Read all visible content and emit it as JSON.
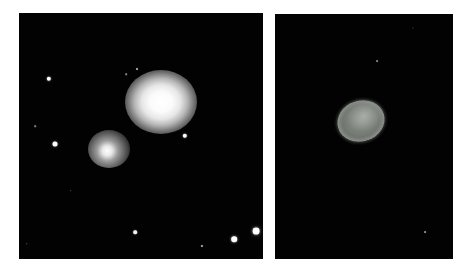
{
  "figure": {
    "panels": [
      {
        "id": "left",
        "description": "Deep-sky field with a large elliptical galaxy and a smaller fuzzy companion galaxy among foreground stars",
        "background_color": "#020202",
        "galaxies": [
          {
            "name": "large-elliptical",
            "cx": 142,
            "cy": 89,
            "w": 72,
            "h": 64
          },
          {
            "name": "small-companion",
            "cx": 90,
            "cy": 136,
            "w": 42,
            "h": 38
          }
        ],
        "stars": [
          {
            "cx": 30,
            "cy": 66,
            "r": 2.2,
            "brightness": 1.0
          },
          {
            "cx": 36,
            "cy": 131,
            "r": 2.5,
            "brightness": 1.0
          },
          {
            "cx": 16,
            "cy": 113,
            "r": 0.8,
            "brightness": 0.5
          },
          {
            "cx": 166,
            "cy": 123,
            "r": 2.2,
            "brightness": 1.0
          },
          {
            "cx": 118,
            "cy": 56,
            "r": 1.0,
            "brightness": 0.7
          },
          {
            "cx": 107,
            "cy": 61,
            "r": 0.8,
            "brightness": 0.5
          },
          {
            "cx": 116,
            "cy": 219,
            "r": 1.8,
            "brightness": 0.95
          },
          {
            "cx": 183,
            "cy": 233,
            "r": 1.1,
            "brightness": 0.7
          },
          {
            "cx": 215,
            "cy": 226,
            "r": 2.8,
            "brightness": 1.0
          },
          {
            "cx": 237,
            "cy": 218,
            "r": 3.4,
            "brightness": 1.0
          },
          {
            "cx": 8,
            "cy": 231,
            "r": 0.7,
            "brightness": 0.4
          },
          {
            "cx": 52,
            "cy": 178,
            "r": 0.7,
            "brightness": 0.35
          }
        ]
      },
      {
        "id": "right",
        "description": "Dark field with a single tilted oval, textured greyish object",
        "background_color": "#020202",
        "object": {
          "name": "oval-object",
          "cx": 86,
          "cy": 107,
          "w": 48,
          "h": 41
        },
        "stars": [
          {
            "cx": 102,
            "cy": 47,
            "r": 0.9,
            "brightness": 0.5
          },
          {
            "cx": 150,
            "cy": 218,
            "r": 0.9,
            "brightness": 0.55
          },
          {
            "cx": 138,
            "cy": 14,
            "r": 0.6,
            "brightness": 0.3
          }
        ]
      }
    ]
  }
}
